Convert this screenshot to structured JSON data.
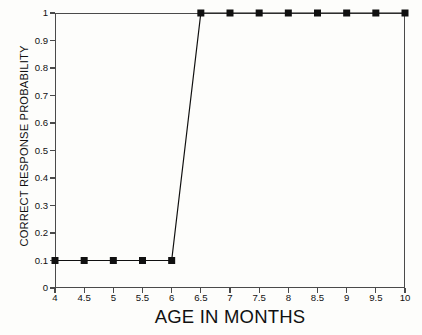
{
  "chart_data": {
    "type": "line",
    "title": "",
    "subtitle": "",
    "xlabel": "AGE IN MONTHS",
    "ylabel": "CORRECT RESPONSE PROBABILITY",
    "xlim": [
      4,
      10
    ],
    "ylim": [
      0,
      1
    ],
    "xticks": [
      4,
      4.5,
      5,
      5.5,
      6,
      6.5,
      7,
      7.5,
      8,
      8.5,
      9,
      9.5,
      10
    ],
    "xticklabels": [
      "4",
      "4.5",
      "5",
      "5.5",
      "6",
      "6.5",
      "7",
      "7.5",
      "8",
      "8.5",
      "9",
      "9.5",
      "10"
    ],
    "yticks": [
      0,
      0.1,
      0.2,
      0.3,
      0.4,
      0.5,
      0.6,
      0.7,
      0.8,
      0.9,
      1
    ],
    "yticklabels": [
      "0",
      "0.1",
      "0.2",
      "0.3",
      "0.4",
      "0.5",
      "0.6",
      "0.7",
      "0.8",
      "0.9",
      "1"
    ],
    "grid": false,
    "legend": null,
    "marker": "square",
    "marker_color": "#101010",
    "line_color": "#101010",
    "series": [
      {
        "name": "Correct response probability",
        "x": [
          4,
          4.5,
          5,
          5.5,
          6,
          6.5,
          7,
          7.5,
          8,
          8.5,
          9,
          9.5,
          10
        ],
        "values": [
          0.1,
          0.1,
          0.1,
          0.1,
          0.1,
          1,
          1,
          1,
          1,
          1,
          1,
          1,
          1
        ]
      }
    ]
  }
}
